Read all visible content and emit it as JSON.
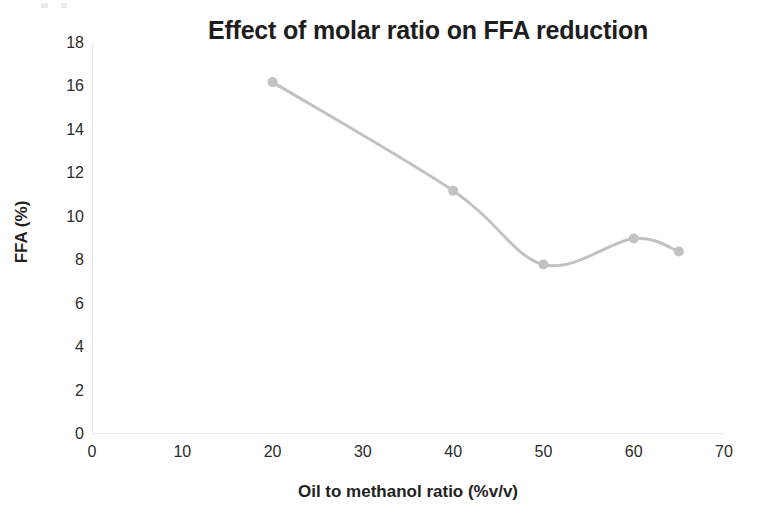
{
  "chart_data": {
    "type": "line",
    "title": "Effect of molar ratio on FFA reduction",
    "xlabel": "Oil to methanol ratio (%v/v)",
    "ylabel": "FFA (%)",
    "xlim": [
      0,
      70
    ],
    "ylim": [
      0,
      18
    ],
    "xticks": [
      0,
      10,
      20,
      30,
      40,
      50,
      60,
      70
    ],
    "yticks": [
      0,
      2,
      4,
      6,
      8,
      10,
      12,
      14,
      16,
      18
    ],
    "grid": false,
    "legend": null,
    "series": [
      {
        "name": "FFA reduction",
        "color": "#c2c2c2",
        "marker": "circle",
        "smooth": true,
        "x": [
          20,
          40,
          50,
          60,
          65
        ],
        "values": [
          16.2,
          11.2,
          7.8,
          9.0,
          8.4
        ]
      }
    ]
  },
  "axes": {
    "y_tick_labels": [
      "18",
      "16",
      "14",
      "12",
      "10",
      "8",
      "6",
      "4",
      "2",
      "0"
    ],
    "x_tick_labels": [
      "0",
      "10",
      "20",
      "30",
      "40",
      "50",
      "60",
      "70"
    ]
  },
  "colors": {
    "line": "#c2c2c2",
    "marker": "#c2c2c2",
    "axis": "#e9e9e9",
    "text": "#231f20",
    "background": "#ffffff"
  }
}
